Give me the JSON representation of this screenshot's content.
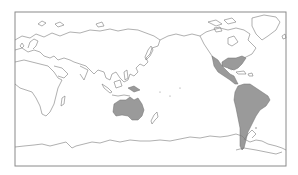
{
  "map": {
    "projection": "Pacific-centered world map",
    "background": "#ffffff",
    "outline_color": "#7a7a7a",
    "highlight_color": "#9a9a9a",
    "highlighted_regions": [
      "Australia",
      "South America",
      "Central America and Mexico",
      "Southeastern United States"
    ]
  }
}
